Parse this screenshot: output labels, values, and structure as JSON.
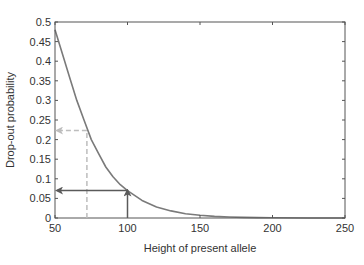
{
  "chart_data": {
    "type": "line",
    "title": "",
    "xlabel": "Height of present allele",
    "ylabel": "Drop-out probability",
    "xlim": [
      50,
      250
    ],
    "ylim": [
      0,
      0.5
    ],
    "xticks": [
      50,
      100,
      150,
      200,
      250
    ],
    "yticks": [
      0,
      0.05,
      0.1,
      0.15,
      0.2,
      0.25,
      0.3,
      0.35,
      0.4,
      0.45,
      0.5
    ],
    "grid": false,
    "legend": null,
    "series": [
      {
        "name": "drop-out curve",
        "color": "#7a7a7a",
        "x": [
          50,
          55,
          60,
          65,
          70,
          75,
          80,
          85,
          90,
          95,
          100,
          110,
          120,
          130,
          140,
          150,
          160,
          170,
          180,
          190,
          200,
          225,
          250
        ],
        "y": [
          0.48,
          0.42,
          0.36,
          0.3,
          0.25,
          0.2,
          0.165,
          0.13,
          0.105,
          0.085,
          0.07,
          0.045,
          0.028,
          0.018,
          0.011,
          0.007,
          0.004,
          0.0025,
          0.0015,
          0.001,
          0.0005,
          0.0001,
          0.0
        ]
      }
    ],
    "annotations": [
      {
        "name": "dashed-arrow",
        "style": "dashed",
        "color": "#bdbdbd",
        "x": 72,
        "y": 0.223,
        "description": "vertical dashed line from x=72 up to curve, then dashed arrow left to y-axis at 0.223"
      },
      {
        "name": "solid-arrow",
        "style": "solid",
        "color": "#5a5a5a",
        "x": 100,
        "y": 0.07,
        "description": "solid arrow up from x=100 to curve, then solid arrow left to y-axis at 0.07"
      }
    ]
  },
  "colors": {
    "axis": "#555555",
    "curve": "#7a7a7a",
    "dashed_annotation": "#bdbdbd",
    "solid_annotation": "#5a5a5a",
    "text": "#333333"
  }
}
